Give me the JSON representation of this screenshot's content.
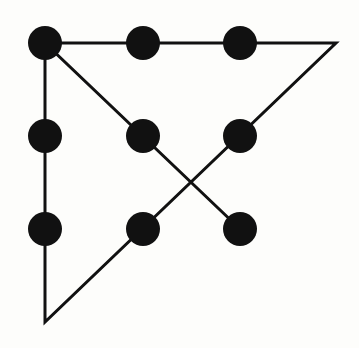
{
  "diagram": {
    "colors": {
      "background": "#fdfdfb",
      "ink": "#111111"
    },
    "dot_radius": 17,
    "dots": [
      {
        "x": 45,
        "y": 43
      },
      {
        "x": 143,
        "y": 43
      },
      {
        "x": 240,
        "y": 43
      },
      {
        "x": 45,
        "y": 136
      },
      {
        "x": 143,
        "y": 136
      },
      {
        "x": 240,
        "y": 136
      },
      {
        "x": 45,
        "y": 229
      },
      {
        "x": 143,
        "y": 229
      },
      {
        "x": 240,
        "y": 229
      }
    ],
    "path": [
      {
        "x": 240,
        "y": 229
      },
      {
        "x": 45,
        "y": 43
      },
      {
        "x": 336,
        "y": 43
      },
      {
        "x": 45,
        "y": 322
      },
      {
        "x": 45,
        "y": 43
      }
    ]
  }
}
